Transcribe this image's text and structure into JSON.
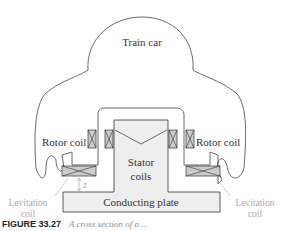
{
  "diagram": {
    "labels": {
      "train_car": "Train car",
      "rotor_coil_left": "Rotor coil",
      "rotor_coil_right": "Rotor coil",
      "stator_coils_line1": "Stator",
      "stator_coils_line2": "coils",
      "levitation_left_line1": "Levitation",
      "levitation_left_line2": "coil",
      "levitation_right_line1": "Levitation",
      "levitation_right_line2": "coil",
      "conducting_plate": "Conducting plate",
      "gap_symbol": "z"
    }
  },
  "caption": {
    "figure": "FIGURE 33.27",
    "text": "A cross section of a ..."
  }
}
